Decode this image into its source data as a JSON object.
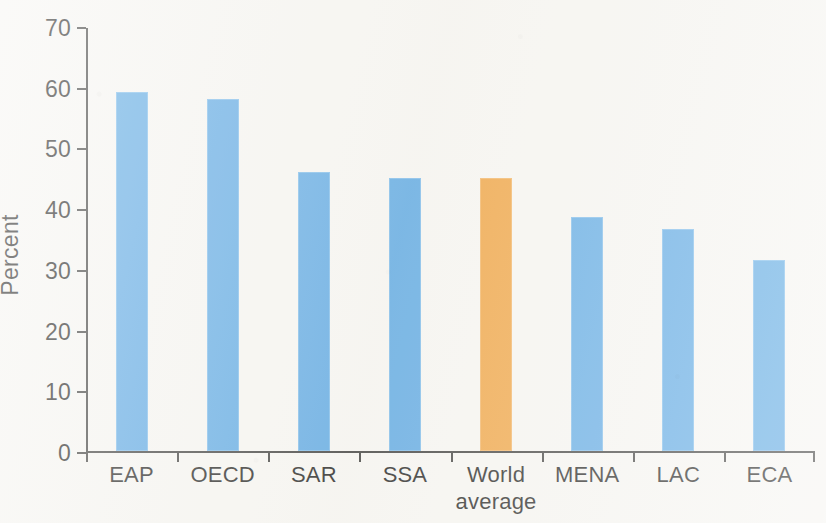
{
  "chart_data": {
    "type": "bar",
    "title": "",
    "subtitle": "",
    "xlabel": "",
    "ylabel": "Percent",
    "categories": [
      "EAP",
      "OECD",
      "SAR",
      "SSA",
      "World\naverage",
      "MENA",
      "LAC",
      "ECA"
    ],
    "values": [
      59.2,
      58.0,
      46.0,
      44.9,
      44.9,
      38.6,
      36.5,
      31.5
    ],
    "bar_colors": [
      "#5aa7e3",
      "#5aa7e3",
      "#5aa7e3",
      "#5aa7e3",
      "#f0a13c",
      "#5aa7e3",
      "#5aa7e3",
      "#5aa7e3"
    ],
    "highlight_category": "World average",
    "ylim": [
      0,
      70
    ],
    "ytick_labels": [
      "0",
      "10",
      "20",
      "30",
      "40",
      "50",
      "60",
      "70"
    ],
    "ytick_values": [
      0,
      10,
      20,
      30,
      40,
      50,
      60,
      70
    ],
    "grid": false,
    "legend": null,
    "legend_position": "none",
    "annotations": []
  },
  "colors": {
    "series_blue": "#5aa7e3",
    "highlight_orange": "#f0a13c",
    "axis": "#3a3a38",
    "text": "#1d1d1b",
    "background": "#f7f6f2"
  }
}
